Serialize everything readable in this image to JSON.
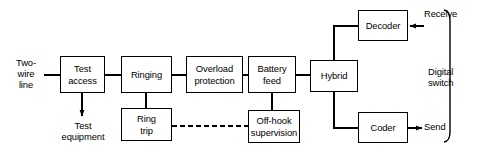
{
  "diagram": {
    "canvas": {
      "width": 482,
      "height": 155
    },
    "style": {
      "line_color": "#000000",
      "box_fill": "#ffffff",
      "text_color": "#000000",
      "background": "#ffffff"
    },
    "boxes": [
      {
        "id": "test_access",
        "label": "Test\naccess",
        "x": 60,
        "y": 56,
        "w": 45,
        "h": 37
      },
      {
        "id": "ringing",
        "label": "Ringing",
        "x": 121,
        "y": 56,
        "w": 51,
        "h": 37
      },
      {
        "id": "overload_protection",
        "label": "Overload\nprotection",
        "x": 186,
        "y": 56,
        "w": 57,
        "h": 37
      },
      {
        "id": "battery_feed",
        "label": "Battery\nfeed",
        "x": 248,
        "y": 56,
        "w": 48,
        "h": 37
      },
      {
        "id": "hybrid",
        "label": "Hybrid",
        "x": 310,
        "y": 60,
        "w": 48,
        "h": 32
      },
      {
        "id": "ring_trip",
        "label": "Ring\ntrip",
        "x": 121,
        "y": 108,
        "w": 51,
        "h": 33
      },
      {
        "id": "off_hook",
        "label": "Off-hook\nsupervision",
        "x": 248,
        "y": 110,
        "w": 52,
        "h": 33
      },
      {
        "id": "decoder",
        "label": "Decoder",
        "x": 358,
        "y": 10,
        "w": 50,
        "h": 31
      },
      {
        "id": "coder",
        "label": "Coder",
        "x": 358,
        "y": 112,
        "w": 50,
        "h": 31
      }
    ],
    "labels": [
      {
        "id": "two_wire_line",
        "text": "Two-\nwire\nline",
        "x": 6,
        "y": 57,
        "w": 40
      },
      {
        "id": "test_equipment",
        "text": "Test\nequipment",
        "x": 44,
        "y": 120,
        "w": 78
      },
      {
        "id": "receive",
        "text": "Receive",
        "x": 424,
        "y": 8,
        "w": 46
      },
      {
        "id": "send",
        "text": "Send",
        "x": 424,
        "y": 121,
        "w": 40
      },
      {
        "id": "digital_switch",
        "text": "Digital\nswitch",
        "x": 428,
        "y": 66,
        "w": 50
      }
    ],
    "connections": [
      {
        "from": "two-wire-line-label",
        "to": "test_access",
        "type": "solid",
        "arrow": false
      },
      {
        "from": "test_access",
        "to": "ringing",
        "type": "solid",
        "arrow": false
      },
      {
        "from": "ringing",
        "to": "overload_protection",
        "type": "solid",
        "arrow": false
      },
      {
        "from": "overload_protection",
        "to": "battery_feed",
        "type": "solid",
        "arrow": false
      },
      {
        "from": "battery_feed",
        "to": "hybrid",
        "type": "solid",
        "arrow": false
      },
      {
        "from": "test_access",
        "to": "test_equipment",
        "type": "solid",
        "arrow": true
      },
      {
        "from": "ringing",
        "to": "ring_trip",
        "type": "solid",
        "arrow": false
      },
      {
        "from": "battery_feed",
        "to": "off_hook",
        "type": "solid",
        "arrow": false
      },
      {
        "from": "ring_trip",
        "to": "off_hook",
        "type": "dashed",
        "arrow": false
      },
      {
        "from": "hybrid",
        "to": "decoder",
        "type": "solid",
        "arrow": false
      },
      {
        "from": "hybrid",
        "to": "coder",
        "type": "solid",
        "arrow": false
      },
      {
        "from": "receive",
        "to": "decoder",
        "type": "solid",
        "arrow": true
      },
      {
        "from": "coder",
        "to": "send",
        "type": "solid",
        "arrow": true
      }
    ],
    "bracket": {
      "id": "digital_switch_bracket",
      "x": 450,
      "y_top": 10,
      "y_bottom": 142
    }
  }
}
